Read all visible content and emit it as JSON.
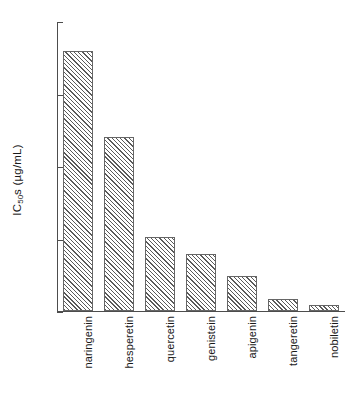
{
  "chart_data": {
    "type": "bar",
    "title": "",
    "xlabel": "",
    "ylabel": "IC 50 s (µg/mL)",
    "ylabel_prefix": "IC",
    "ylabel_sub": "50",
    "ylabel_suffix": "s (µg/mL)",
    "categories": [
      "naringenin",
      "hesperetin",
      "quercetin",
      "genistein",
      "apigenin",
      "tangeretin",
      "nobiletin"
    ],
    "values": [
      17.9,
      12.0,
      5.1,
      3.9,
      2.4,
      0.8,
      0.4
    ],
    "ylim": [
      0,
      20
    ],
    "yticks": [
      0,
      5,
      10,
      15,
      20
    ],
    "ytick_labels": [
      "0",
      "5",
      "10",
      "15",
      "20"
    ],
    "grid": false,
    "legend": null,
    "bar_fill": "hatched-diagonal",
    "bar_edge_color": "#666666",
    "axis_color": "#4d4d4d"
  }
}
